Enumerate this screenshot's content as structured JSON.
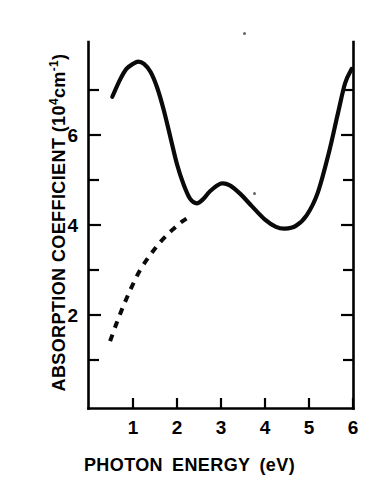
{
  "figure": {
    "name": "absorption-spectrum-figure",
    "background": "#ffffff",
    "ink_color": "#0a0a0a"
  },
  "axes": {
    "x": {
      "title_main": "PHOTON",
      "title_second": "ENERGY",
      "title_unit": "(eV)",
      "title_full": "PHOTON ENERGY (eV)",
      "tick_labels": [
        "1",
        "2",
        "3",
        "4",
        "5",
        "6"
      ],
      "tick_values": [
        1,
        2,
        3,
        4,
        5,
        6
      ],
      "range": [
        0.3,
        6.0
      ]
    },
    "y": {
      "title_text": "ABSORPTION COEFFICIENT (10",
      "title_exp": "4",
      "title_unit": "cm",
      "title_unit_exp": "-1",
      "title_close": ")",
      "title_full": "ABSORPTION COEFFICIENT (10⁴cm⁻¹)",
      "tick_labels": [
        "2",
        "4",
        "6"
      ],
      "labeled_values": [
        2,
        4,
        6
      ],
      "minor_values": [
        1,
        3,
        5,
        7
      ],
      "range": [
        0.0,
        8.1
      ]
    }
  },
  "chart_data": {
    "type": "line",
    "title": "",
    "xlabel": "PHOTON ENERGY (eV)",
    "ylabel": "ABSORPTION COEFFICIENT (10⁴cm⁻¹)",
    "xlim": [
      0.3,
      6.0
    ],
    "ylim": [
      0.0,
      8.1
    ],
    "grid": false,
    "legend": "none",
    "axis_style": "left-right-bottom frame, inward ticks, no top spine",
    "series": [
      {
        "name": "absorption coefficient (measured)",
        "style": "solid",
        "color": "#0a0a0a",
        "x": [
          0.53,
          0.7,
          0.85,
          1.0,
          1.12,
          1.25,
          1.4,
          1.55,
          1.7,
          1.85,
          2.0,
          2.15,
          2.3,
          2.45,
          2.6,
          2.75,
          3.0,
          3.2,
          3.45,
          3.7,
          4.0,
          4.25,
          4.45,
          4.7,
          4.95,
          5.2,
          5.45,
          5.65,
          5.82,
          5.97
        ],
        "y": [
          6.85,
          7.22,
          7.47,
          7.58,
          7.63,
          7.58,
          7.4,
          7.05,
          6.55,
          5.95,
          5.35,
          4.9,
          4.58,
          4.48,
          4.58,
          4.75,
          4.92,
          4.88,
          4.68,
          4.42,
          4.12,
          3.96,
          3.92,
          3.98,
          4.22,
          4.72,
          5.6,
          6.45,
          7.15,
          7.47
        ]
      },
      {
        "name": "extrapolated baseline (dashed)",
        "style": "dashed",
        "color": "#0a0a0a",
        "x": [
          0.48,
          0.62,
          0.78,
          0.95,
          1.15,
          1.38,
          1.62,
          1.88,
          2.12,
          2.35
        ],
        "y": [
          1.42,
          1.8,
          2.2,
          2.58,
          2.98,
          3.32,
          3.62,
          3.88,
          4.08,
          4.22
        ]
      }
    ],
    "features": {
      "primary_peak": {
        "x": 1.12,
        "y": 7.63
      },
      "local_minimum": {
        "x": 2.45,
        "y": 4.48
      },
      "secondary_peak": {
        "x": 3.0,
        "y": 4.92
      },
      "broad_minimum": {
        "x": 4.45,
        "y": 3.92
      },
      "right_edge": {
        "x": 5.97,
        "y": 7.47
      },
      "left_edge": {
        "x": 0.53,
        "y": 6.85
      }
    }
  }
}
